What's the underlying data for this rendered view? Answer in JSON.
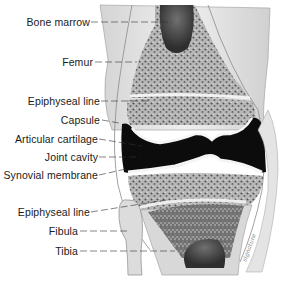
{
  "figure": {
    "labels": [
      {
        "id": "bone-marrow",
        "text": "Bone marrow",
        "right": 90,
        "y": 16
      },
      {
        "id": "femur",
        "text": "Femur",
        "right": 93,
        "y": 56
      },
      {
        "id": "epiphyseal-line-upper",
        "text": "Epiphyseal line",
        "right": 100,
        "y": 96
      },
      {
        "id": "capsule",
        "text": "Capsule",
        "right": 100,
        "y": 114
      },
      {
        "id": "articular-cartilage",
        "text": "Articular cartilage",
        "right": 98,
        "y": 133
      },
      {
        "id": "joint-cavity",
        "text": "Joint cavity",
        "right": 98,
        "y": 151
      },
      {
        "id": "synovial-membrane",
        "text": "Synovial membrane",
        "right": 98,
        "y": 169
      },
      {
        "id": "epiphyseal-line-lower",
        "text": "Epiphyseal line",
        "right": 89,
        "y": 206
      },
      {
        "id": "fibula",
        "text": "Fibula",
        "right": 78,
        "y": 225
      },
      {
        "id": "tibia",
        "text": "Tibia",
        "right": 78,
        "y": 245
      }
    ],
    "signature": "artist signature"
  }
}
